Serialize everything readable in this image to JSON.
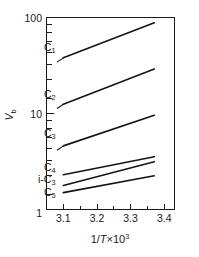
{
  "figure": {
    "name": "arrhenius-plot",
    "background_color": "#ffffff",
    "line_color": "#141414"
  },
  "axes": {
    "y": {
      "label_main": "V",
      "label_sub": "b",
      "scale": "log",
      "tick_labels": [
        "100",
        "10",
        "1"
      ],
      "range": [
        1,
        100
      ]
    },
    "x": {
      "label_prefix": "1/",
      "label_italic": "T",
      "label_mid": "×10",
      "label_exp": "3",
      "scale": "linear",
      "tick_labels": [
        "3.1",
        "3.2",
        "3.3",
        "3.4"
      ],
      "range": [
        3.05,
        3.43
      ]
    }
  },
  "curve_labels": [
    {
      "main": "C",
      "sub": "1"
    },
    {
      "main": "C",
      "sub": "2"
    },
    {
      "main": "C",
      "sub": "3"
    },
    {
      "main": "C",
      "sub": "4"
    },
    {
      "prefix": "i-",
      "main": "C",
      "sub": "3"
    },
    {
      "main": "C",
      "sub": "5"
    }
  ],
  "chart_data": {
    "type": "line",
    "title": "",
    "xlabel": "1/T×10³",
    "ylabel": "V_b",
    "xscale": "linear",
    "yscale": "log",
    "xlim": [
      3.05,
      3.43
    ],
    "ylim": [
      1,
      100
    ],
    "xticks": [
      3.1,
      3.2,
      3.3,
      3.4
    ],
    "yticks": [
      1,
      10,
      100
    ],
    "grid": false,
    "legend": "inline-labels-left",
    "series": [
      {
        "name": "C1",
        "label": "C₁",
        "x": [
          3.1,
          3.37
        ],
        "y": [
          38,
          88
        ]
      },
      {
        "name": "C2",
        "label": "C₂",
        "x": [
          3.1,
          3.37
        ],
        "y": [
          12.5,
          29
        ]
      },
      {
        "name": "C3",
        "label": "C₃",
        "x": [
          3.1,
          3.37
        ],
        "y": [
          4.6,
          9.6
        ]
      },
      {
        "name": "C4",
        "label": "C₄",
        "x": [
          3.1,
          3.37
        ],
        "y": [
          2.3,
          3.55
        ]
      },
      {
        "name": "i-C3",
        "label": "i-C₃",
        "x": [
          3.1,
          3.37
        ],
        "y": [
          1.78,
          3.15
        ]
      },
      {
        "name": "C5",
        "label": "C₅",
        "x": [
          3.1,
          3.37
        ],
        "y": [
          1.5,
          2.25
        ]
      }
    ]
  }
}
